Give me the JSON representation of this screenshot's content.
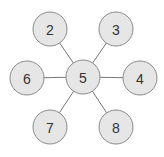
{
  "diagram": {
    "type": "star-graph",
    "center": {
      "id": "5",
      "label": "5",
      "x": 83,
      "y": 77
    },
    "nodes": [
      {
        "id": "2",
        "label": "2",
        "x": 50,
        "y": 29
      },
      {
        "id": "3",
        "label": "3",
        "x": 116,
        "y": 29
      },
      {
        "id": "6",
        "label": "6",
        "x": 27,
        "y": 78
      },
      {
        "id": "4",
        "label": "4",
        "x": 140,
        "y": 78
      },
      {
        "id": "7",
        "label": "7",
        "x": 50,
        "y": 127
      },
      {
        "id": "8",
        "label": "8",
        "x": 116,
        "y": 127
      }
    ],
    "edges": [
      [
        "5",
        "2"
      ],
      [
        "5",
        "3"
      ],
      [
        "5",
        "6"
      ],
      [
        "5",
        "4"
      ],
      [
        "5",
        "7"
      ],
      [
        "5",
        "8"
      ]
    ],
    "node_radius": 17,
    "colors": {
      "fill": "#e6e6e6",
      "stroke": "#8a8a8a",
      "edge": "#777777",
      "text": "#333333"
    }
  }
}
